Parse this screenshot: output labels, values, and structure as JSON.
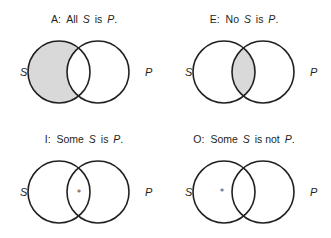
{
  "figure": "Venn diagrams of the four categorical propositions",
  "colors": {
    "stroke": "#231f20",
    "shade": "#d9d9d9",
    "background": "#ffffff"
  },
  "panels": [
    {
      "id": "A",
      "title_prefix": "A:",
      "title_word1": "All",
      "title_subject": "S",
      "title_mid": "is",
      "title_predicate": "P",
      "title_end": ".",
      "left_label": "S",
      "right_label": "P",
      "shaded_region": "S-only",
      "marker": null
    },
    {
      "id": "E",
      "title_prefix": "E:",
      "title_word1": "No",
      "title_subject": "S",
      "title_mid": "is",
      "title_predicate": "P",
      "title_end": ".",
      "left_label": "S",
      "right_label": "P",
      "shaded_region": "S-and-P",
      "marker": null
    },
    {
      "id": "I",
      "title_prefix": "I:",
      "title_word1": "Some",
      "title_subject": "S",
      "title_mid": "is",
      "title_predicate": "P",
      "title_end": ".",
      "left_label": "S",
      "right_label": "P",
      "shaded_region": null,
      "marker": "*",
      "marker_region": "S-and-P"
    },
    {
      "id": "O",
      "title_prefix": "O:",
      "title_word1": "Some",
      "title_subject": "S",
      "title_mid": "is not",
      "title_predicate": "P",
      "title_end": ".",
      "left_label": "S",
      "right_label": "P",
      "shaded_region": null,
      "marker": "*",
      "marker_region": "S-only"
    }
  ]
}
